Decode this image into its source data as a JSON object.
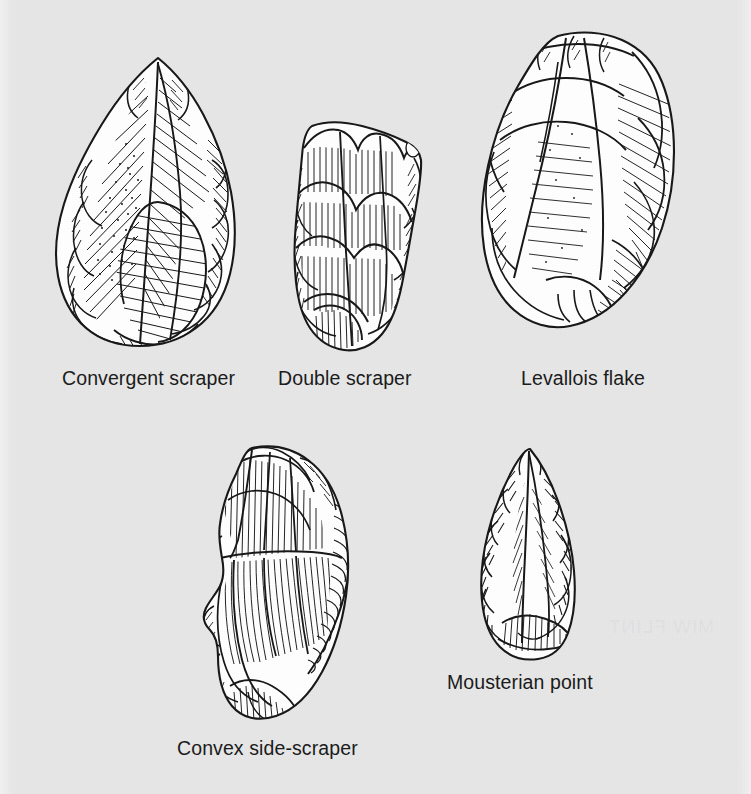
{
  "figure": {
    "kind": "archaeological-illustration-plate",
    "background_color": "#e8e8e8",
    "ink_color": "#1a1a1a",
    "page_width": 751,
    "page_height": 794
  },
  "artifacts": [
    {
      "id": "convergent-scraper",
      "label": "Convergent scraper",
      "caption_x": 62,
      "caption_y": 369,
      "drawing_x": 40,
      "drawing_y": 52,
      "drawing_w": 240,
      "drawing_h": 300
    },
    {
      "id": "double-scraper",
      "label": "Double scraper",
      "caption_x": 278,
      "caption_y": 369,
      "drawing_x": 278,
      "drawing_y": 112,
      "drawing_w": 165,
      "drawing_h": 245
    },
    {
      "id": "levallois-flake",
      "label": "Levallois flake",
      "caption_x": 521,
      "caption_y": 369,
      "drawing_x": 462,
      "drawing_y": 22,
      "drawing_w": 230,
      "drawing_h": 335
    },
    {
      "id": "convex-side-scraper",
      "label": "Convex side-scraper",
      "caption_x": 177,
      "caption_y": 739,
      "drawing_x": 186,
      "drawing_y": 440,
      "drawing_w": 195,
      "drawing_h": 285
    },
    {
      "id": "mousterian-point",
      "label": "Mousterian point",
      "caption_x": 447,
      "caption_y": 673,
      "drawing_x": 458,
      "drawing_y": 443,
      "drawing_w": 145,
      "drawing_h": 220
    }
  ],
  "ghost_text": {
    "line": "MIW FLINT"
  }
}
